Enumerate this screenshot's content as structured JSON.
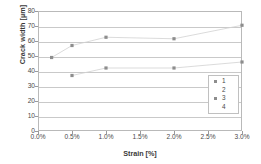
{
  "chart_data": {
    "type": "scatter",
    "title": "",
    "xlabel": "Strain [%]",
    "ylabel": "Crack width [µm]",
    "xlim": [
      0.0,
      3.0
    ],
    "ylim": [
      0,
      80
    ],
    "grid": true,
    "legend_position": "inside-lower-right",
    "x_tick_labels": [
      "0.0%",
      "0.5%",
      "1.0%",
      "1.5%",
      "2.0%",
      "2.5%",
      "3.0%"
    ],
    "x_tick_values": [
      0.0,
      0.5,
      1.0,
      1.5,
      2.0,
      2.5,
      3.0
    ],
    "y_tick_labels": [
      "0",
      "10",
      "20",
      "30",
      "40",
      "50",
      "60",
      "70",
      "80"
    ],
    "y_tick_values": [
      0,
      10,
      20,
      30,
      40,
      50,
      60,
      70,
      80
    ],
    "series": [
      {
        "name": "1",
        "kind": "markers",
        "marker": "square",
        "color": "#8d8d8d",
        "x": [
          0.2,
          0.5,
          1.0,
          2.0,
          3.0
        ],
        "values": [
          49,
          57,
          62.5,
          61.5,
          70.5
        ]
      },
      {
        "name": "2",
        "kind": "line",
        "color": "#d2d2d2",
        "x": [
          0.2,
          0.5,
          1.0,
          2.0,
          3.0
        ],
        "values": [
          49,
          57,
          62.5,
          61.5,
          70.5
        ]
      },
      {
        "name": "3",
        "kind": "markers",
        "marker": "square",
        "color": "#8d8d8d",
        "x": [
          0.5,
          1.0,
          2.0,
          3.0
        ],
        "values": [
          37,
          42,
          42,
          46
        ]
      },
      {
        "name": "4",
        "kind": "line",
        "color": "#d2d2d2",
        "x": [
          0.5,
          1.0,
          2.0,
          3.0
        ],
        "values": [
          37,
          42,
          42,
          46
        ]
      }
    ],
    "legend_entries": [
      {
        "label": "1",
        "has_marker": true,
        "has_line": false
      },
      {
        "label": "2",
        "has_marker": false,
        "has_line": false
      },
      {
        "label": "3",
        "has_marker": true,
        "has_line": false
      },
      {
        "label": "4",
        "has_marker": false,
        "has_line": false
      }
    ],
    "colors": {
      "axis": "#b9b9b9",
      "grid": "#c9c9c9",
      "marker": "#8d8d8d",
      "trendline": "#d2d2d2",
      "text": "#3a3a3a",
      "background": "#ffffff"
    }
  }
}
